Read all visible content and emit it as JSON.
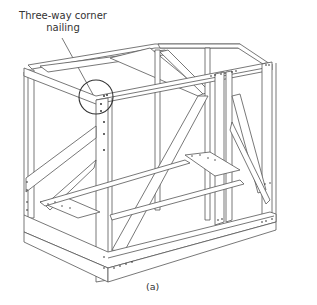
{
  "figure": {
    "callout": {
      "line1": "Three-way corner",
      "line2": "nailing"
    },
    "caption": "(a)"
  }
}
